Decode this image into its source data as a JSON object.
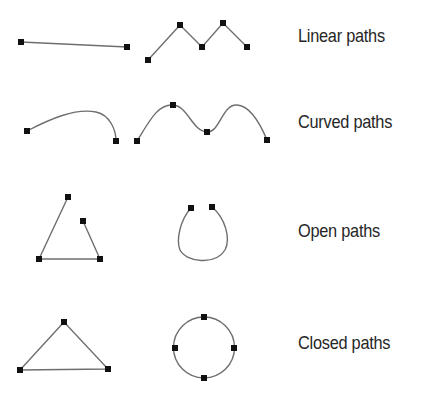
{
  "rows": [
    {
      "label": "Linear paths",
      "top": 26
    },
    {
      "label": "Curved paths",
      "top": 112
    },
    {
      "label": "Open paths",
      "top": 221
    },
    {
      "label": "Closed paths",
      "top": 333
    }
  ],
  "colors": {
    "stroke": "#6e6e6e",
    "anchor": "#111111",
    "text": "#262626",
    "background": "#ffffff"
  },
  "anchor_size": 6,
  "figures": {
    "linear_simple": {
      "d": "M21,42 L127,47",
      "anchors": [
        [
          21,
          42
        ],
        [
          127,
          47
        ]
      ]
    },
    "linear_zigzag": {
      "d": "M148,60 L180,25 L202,47 L223,23 L247,47",
      "anchors": [
        [
          148,
          60
        ],
        [
          180,
          25
        ],
        [
          202,
          47
        ],
        [
          223,
          23
        ],
        [
          247,
          47
        ]
      ]
    },
    "curved_simple": {
      "d": "M27,131 C50,119 75,108 96,112 C110,115 116,130 116,141",
      "anchors": [
        [
          27,
          131
        ],
        [
          116,
          141
        ]
      ]
    },
    "curved_wave": {
      "d": "M137,141 C150,120 158,104 173,105 C188,106 192,131 207,132 C220,133 222,104 237,105 C252,106 262,128 267,140",
      "anchors": [
        [
          137,
          141
        ],
        [
          173,
          105
        ],
        [
          207,
          132
        ],
        [
          267,
          140
        ]
      ]
    },
    "open_polyline": {
      "d": "M68,197 L39,259 L100,259 L83,221",
      "anchors": [
        [
          68,
          197
        ],
        [
          39,
          259
        ],
        [
          100,
          259
        ],
        [
          83,
          221
        ]
      ]
    },
    "open_loop": {
      "d": "M191,208 C180,220 176,240 180,250 C186,262 215,266 225,250 C231,238 225,218 212,207",
      "anchors": [
        [
          191,
          208
        ],
        [
          212,
          207
        ]
      ]
    },
    "closed_triangle": {
      "d": "M64,322 L20,370 L108,369 Z",
      "anchors": [
        [
          64,
          322
        ],
        [
          20,
          370
        ],
        [
          108,
          369
        ]
      ]
    },
    "closed_circle": {
      "d": "M204,317 A30,30 0 1,1 204,378 A30,30 0 1,1 204,317 Z",
      "anchors": [
        [
          204,
          317
        ],
        [
          175,
          348
        ],
        [
          234,
          348
        ],
        [
          204,
          378
        ]
      ]
    }
  }
}
